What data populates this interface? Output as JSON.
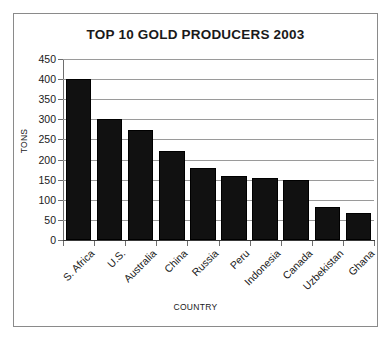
{
  "chart_data": {
    "type": "bar",
    "title": "TOP 10 GOLD PRODUCERS 2003",
    "xlabel": "COUNTRY",
    "ylabel": "TONS",
    "categories": [
      "S. Africa",
      "U.S.",
      "Australia",
      "China",
      "Russia",
      "Peru",
      "Indonesia",
      "Canada",
      "Uzbekistan",
      "Ghana"
    ],
    "values": [
      400,
      300,
      273,
      222,
      178,
      158,
      153,
      148,
      82,
      67
    ],
    "ylim": [
      0,
      450
    ],
    "yticks": [
      0,
      50,
      100,
      150,
      200,
      250,
      300,
      350,
      400,
      450
    ],
    "ytick_labels": [
      "0",
      "50",
      "100",
      "150",
      "200",
      "250",
      "300",
      "350",
      "400",
      "450"
    ],
    "grid": true,
    "legend": "none",
    "bar_color": "#111111",
    "grid_color": "#9a9a9a",
    "axis_color": "#6e6e6e",
    "border_color": "#8a8a8a"
  }
}
